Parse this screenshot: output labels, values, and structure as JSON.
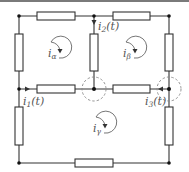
{
  "diagram": {
    "type": "electrical-circuit-mesh-analysis",
    "colors": {
      "wire": "#333333",
      "node": "#111111",
      "dashed_circle": "#888888",
      "label": "#555555"
    },
    "branch_currents": [
      {
        "id": "i1",
        "symbol": "i",
        "sub": "1",
        "arg": "(t)",
        "direction": "right"
      },
      {
        "id": "i2",
        "symbol": "i",
        "sub": "2",
        "arg": "(t)",
        "direction": "down"
      },
      {
        "id": "i3",
        "symbol": "i",
        "sub": "3",
        "arg": "(t)",
        "direction": "left"
      }
    ],
    "mesh_currents": [
      {
        "id": "alpha",
        "symbol": "i",
        "sub": "α",
        "orientation": "clockwise"
      },
      {
        "id": "beta",
        "symbol": "i",
        "sub": "β",
        "orientation": "clockwise"
      },
      {
        "id": "gamma",
        "symbol": "i",
        "sub": "γ",
        "orientation": "clockwise"
      }
    ],
    "resistor_count": 10,
    "node_count": 8,
    "highlighted_nodes": 2
  }
}
